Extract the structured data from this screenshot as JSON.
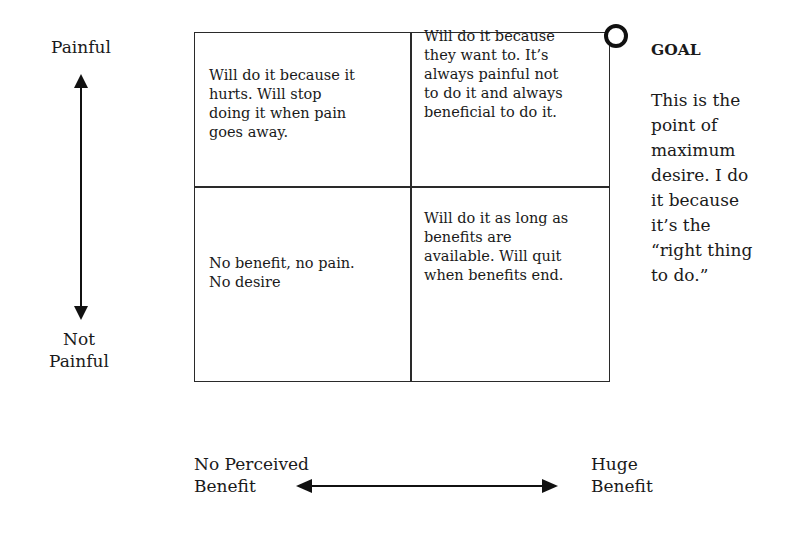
{
  "y_axis": {
    "top_label": "Painful",
    "bottom_label_line1": "Not",
    "bottom_label_line2": "Painful"
  },
  "x_axis": {
    "left_label_line1": "No Perceived",
    "left_label_line2": "Benefit",
    "right_label_line1": "Huge",
    "right_label_line2": "Benefit"
  },
  "quadrants": {
    "top_left": "Will do it because it\nhurts.  Will stop\ndoing it when pain\ngoes away.",
    "top_right": "Will do it because\nthey want to. It’s\nalways painful not\nto do it and always\nbeneficial to do it.",
    "bottom_left": "No benefit, no pain.\nNo desire",
    "bottom_right": "Will do it as long as\nbenefits are\navailable. Will quit\nwhen benefits end."
  },
  "goal": {
    "title": "GOAL",
    "description": "This is the\npoint of\nmaximum\ndesire. I do\nit because\nit’s the\n“right thing\nto do.”"
  },
  "colors": {
    "ink": "#1a1a1a",
    "background": "#ffffff"
  }
}
